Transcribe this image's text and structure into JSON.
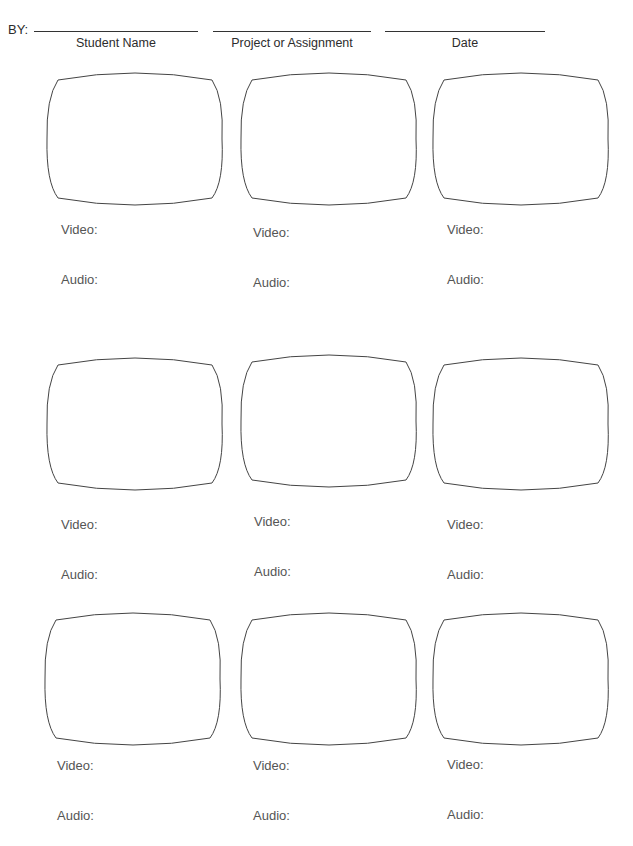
{
  "header": {
    "by_label": "BY:",
    "fields": [
      {
        "caption": "Student Name",
        "value": ""
      },
      {
        "caption": "Project or Assignment",
        "value": ""
      },
      {
        "caption": "Date",
        "value": ""
      }
    ]
  },
  "panels": [
    {
      "video_label": "Video:",
      "audio_label": "Audio:"
    },
    {
      "video_label": "Video:",
      "audio_label": "Audio:"
    },
    {
      "video_label": "Video:",
      "audio_label": "Audio:"
    },
    {
      "video_label": "Video:",
      "audio_label": "Audio:"
    },
    {
      "video_label": "Video:",
      "audio_label": "Audio:"
    },
    {
      "video_label": "Video:",
      "audio_label": "Audio:"
    },
    {
      "video_label": "Video:",
      "audio_label": "Audio:"
    },
    {
      "video_label": "Video:",
      "audio_label": "Audio:"
    },
    {
      "video_label": "Video:",
      "audio_label": "Audio:"
    }
  ]
}
